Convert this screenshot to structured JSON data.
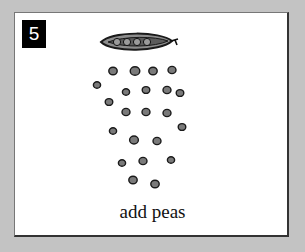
{
  "step": {
    "number": "5",
    "caption": "add peas"
  },
  "illustration": {
    "pod_icon": "pea-pod-icon",
    "pea_icon": "pea-icon",
    "pea_count": 24,
    "colors": {
      "pea_fill": "#7a7a7a",
      "pea_outline": "#1a1a1a",
      "pod_fill": "#8c8c8c",
      "background": "#c3c3c3",
      "card": "#ffffff"
    }
  }
}
